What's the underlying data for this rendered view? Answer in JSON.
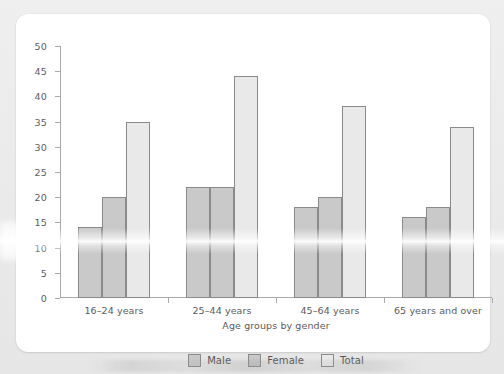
{
  "chart_data": {
    "type": "bar",
    "title": "",
    "xlabel": "Age groups by gender",
    "ylabel": "",
    "categories": [
      "16–24 years",
      "25–44 years",
      "45–64 years",
      "65 years and over"
    ],
    "series": [
      {
        "name": "Male",
        "values": [
          14,
          22,
          18,
          16
        ],
        "color": "#c9c9c9"
      },
      {
        "name": "Female",
        "values": [
          20,
          22,
          20,
          18
        ],
        "color": "#c9c9c9"
      },
      {
        "name": "Total",
        "values": [
          35,
          44,
          38,
          34
        ],
        "color": "#e9e9e9"
      }
    ],
    "ylim": [
      0,
      50
    ],
    "yticks": [
      0,
      5,
      10,
      15,
      20,
      25,
      30,
      35,
      40,
      45,
      50
    ],
    "ytick_labels": [
      "0",
      "5",
      "10",
      "15",
      "20",
      "25",
      "30",
      "35",
      "40",
      "45",
      "50"
    ],
    "grid": false,
    "legend_position": "bottom",
    "bar_border_color": "#8a8a8a",
    "axis_color": "#a9a9a9",
    "text_color": "#5a5a5a",
    "background": "#ffffff"
  },
  "legend": {
    "entries": [
      {
        "label": "Male",
        "series": "male"
      },
      {
        "label": "Female",
        "series": "female"
      },
      {
        "label": "Total",
        "series": "total"
      }
    ]
  },
  "axes": {
    "x_axis_title": "Age groups by gender"
  }
}
